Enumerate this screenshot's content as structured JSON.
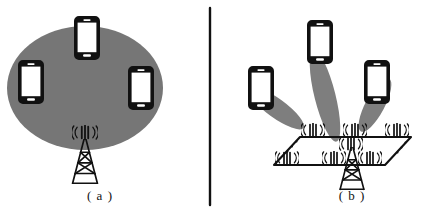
{
  "figure": {
    "title": "",
    "background_color": "#ffffff",
    "width": 424,
    "height": 214,
    "divider": {
      "name": "panel-divider",
      "x": 210,
      "y1": 8,
      "y2": 205,
      "color": "#111111"
    }
  },
  "colors": {
    "coverage_gray": "#767676",
    "beam_gray": "#7e7e7e",
    "ink_black": "#111111",
    "phone_body": "#111111",
    "phone_screen": "#ffffff",
    "background": "#ffffff"
  },
  "panels": [
    {
      "id": "a",
      "caption": "( a )",
      "description": "conventional-sector-coverage",
      "coverage": {
        "name": "coverage-ellipse",
        "shape": "ellipse",
        "cx": 85,
        "cy": 88,
        "rx": 78,
        "ry": 62,
        "fill": "#767676"
      },
      "devices": [
        {
          "name": "phone-top",
          "x": 86,
          "y": 16,
          "rot": 0
        },
        {
          "name": "phone-left",
          "x": 30,
          "y": 60,
          "rot": 0
        },
        {
          "name": "phone-right",
          "x": 140,
          "y": 66,
          "rot": 0
        }
      ],
      "tower": {
        "name": "base-station-tower",
        "x": 85,
        "y": 132,
        "antenna_icon": "((|||))",
        "antenna_count": 1
      }
    },
    {
      "id": "b",
      "caption": "( b )",
      "description": "massive-mimo-beamforming",
      "devices": [
        {
          "name": "phone-left",
          "x": 250,
          "y": 68,
          "beam_angle": 38,
          "beam_len": 62
        },
        {
          "name": "phone-center",
          "x": 309,
          "y": 22,
          "beam_angle": 102,
          "beam_len": 92
        },
        {
          "name": "phone-right",
          "x": 367,
          "y": 62,
          "beam_angle": 130,
          "beam_len": 62
        }
      ],
      "antenna_array": {
        "name": "antenna-array-plane",
        "shape": "parallelogram",
        "corners": [
          [
            300,
            137
          ],
          [
            411,
            137
          ],
          [
            385,
            165
          ],
          [
            274,
            165
          ]
        ],
        "rows": [
          {
            "name": "array-row-back",
            "antenna_count": 3
          },
          {
            "name": "array-row-middle",
            "antenna_count": 1
          },
          {
            "name": "array-row-front",
            "antenna_count": 3
          }
        ],
        "total_antennas_drawn": 8,
        "ellipsis_marks": 2,
        "antenna_icon": "((|||))"
      },
      "tower": {
        "name": "base-station-tower",
        "x": 352,
        "y": 150,
        "antenna_icon": "((|||))"
      }
    }
  ],
  "captions": {
    "a": "( a )",
    "b": "( b )"
  }
}
